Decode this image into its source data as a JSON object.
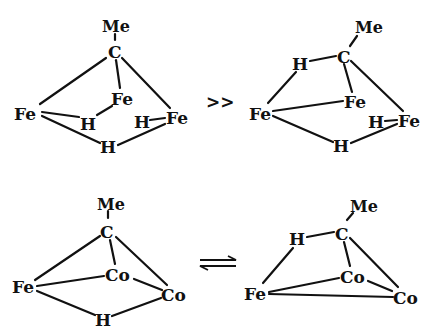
{
  "figure": {
    "schemes": [
      {
        "id": "fe3-scheme",
        "left_structure": {
          "atoms": {
            "me": "Me",
            "c": "C",
            "fe_left": "Fe",
            "fe_mid": "Fe",
            "fe_right": "Fe",
            "h_left": "H",
            "h_right": "H",
            "h_bottom": "H"
          }
        },
        "relation": ">>",
        "right_structure": {
          "atoms": {
            "me": "Me",
            "c": "C",
            "h_top": "H",
            "fe_left": "Fe",
            "fe_mid": "Fe",
            "fe_right": "Fe",
            "h_right": "H",
            "h_bottom": "H"
          }
        }
      },
      {
        "id": "feco2-scheme",
        "left_structure": {
          "atoms": {
            "me": "Me",
            "c": "C",
            "fe": "Fe",
            "co_mid": "Co",
            "co_right": "Co",
            "h_bottom": "H"
          }
        },
        "relation": "equilibrium",
        "right_structure": {
          "atoms": {
            "me": "Me",
            "c": "C",
            "h_top": "H",
            "fe": "Fe",
            "co_mid": "Co",
            "co_right": "Co"
          }
        }
      }
    ]
  }
}
